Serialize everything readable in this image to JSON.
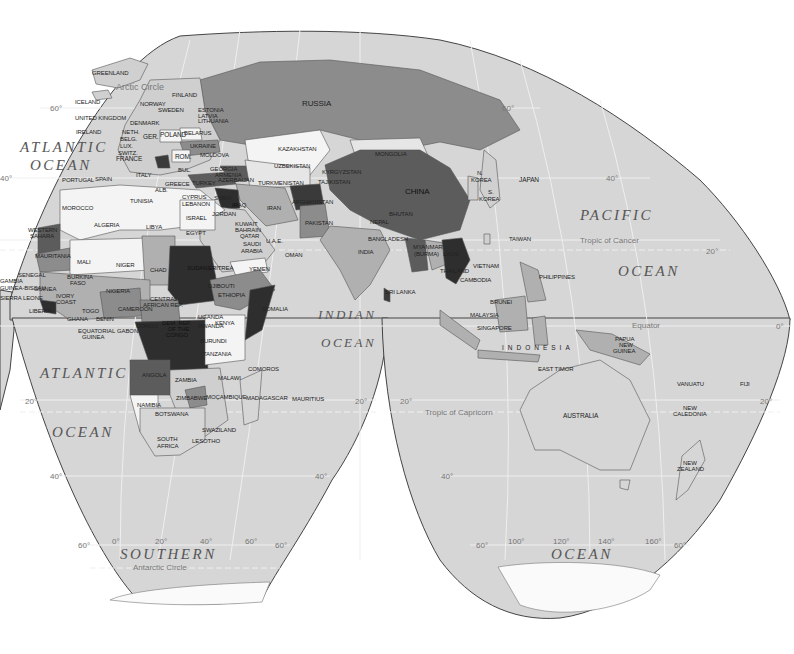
{
  "map": {
    "projection": "interrupted-equal-area",
    "colors": {
      "background": "#ffffff",
      "ocean": "#d6d6d6",
      "graticule": "#efefef",
      "outline": "#444444",
      "shade_0_white": "#f4f4f4",
      "shade_1_light": "#b9b9b9",
      "shade_2_medium": "#8c8c8c",
      "shade_3_dark": "#5c5c5c",
      "shade_4_darkest": "#2e2e2e"
    },
    "oceans": {
      "atlantic_north_1": "ATLANTIC",
      "atlantic_north_2": "OCEAN",
      "atlantic_south_1": "ATLANTIC",
      "atlantic_south_2": "OCEAN",
      "pacific_1": "PACIFIC",
      "pacific_2": "OCEAN",
      "indian_1": "INDIAN",
      "indian_2": "OCEAN",
      "southern_1": "SOUTHERN",
      "southern_2": "OCEAN"
    },
    "lines": {
      "arctic_circle": "Arctic Circle",
      "tropic_cancer": "Tropic of Cancer",
      "equator": "Equator",
      "tropic_capricorn": "Tropic of Capricorn",
      "antarctic_circle": "Antarctic Circle"
    },
    "graticule_labels": {
      "lat_60n_w": "60°",
      "lat_40n_w": "40°",
      "lat_60n_e": "60°",
      "lat_40n_e": "40°",
      "lat_20n_e": "20°",
      "lat_0_e": "0°",
      "lat_20s_w": "20°",
      "lat_20s_mid_l": "20°",
      "lat_20s_mid_r": "20°",
      "lat_20s_e": "20°",
      "lat_40s_w": "40°",
      "lat_40s_mid": "40°",
      "lat_40s_e": "40°",
      "lat_60s_1": "60°",
      "lat_60s_2": "60°",
      "lat_60s_3": "60°",
      "lat_60s_4": "60°",
      "lon_0": "0°",
      "lon_20": "20°",
      "lon_40": "40°",
      "lon_60": "60°",
      "lon_100": "100°",
      "lon_120": "120°",
      "lon_140": "140°",
      "lon_160": "160°"
    },
    "countries": {
      "greenland": "GREENLAND",
      "iceland": "ICELAND",
      "uk": "UNITED KINGDOM",
      "ireland": "IRELAND",
      "norway": "NORWAY",
      "sweden": "SWEDEN",
      "finland": "FINLAND",
      "denmark": "DENMARK",
      "estonia": "ESTONIA",
      "latvia": "LATVIA",
      "lithuania": "LITHUANIA",
      "neth": "NETH.",
      "belg": "BELG.",
      "lux": "LUX.",
      "switz": "SWITZ.",
      "ger": "GER.",
      "poland": "POLAND",
      "belarus": "BELARUS",
      "ukraine": "UKRAINE",
      "moldova": "MOLDOVA",
      "rom": "ROM.",
      "bul": "BUL.",
      "france": "FRANCE",
      "portugal": "PORTUGAL",
      "spain": "SPAIN",
      "italy": "ITALY",
      "alb": "ALB.",
      "greece": "GREECE",
      "russia": "RUSSIA",
      "georgia": "GEORGIA",
      "armenia": "ARMENIA",
      "azerbaijan": "AZERBAIJAN",
      "turkey": "TURKEY",
      "cyprus": "CYPRUS",
      "lebanon": "LEBANON",
      "syria": "SYRIA",
      "israel": "ISRAEL",
      "jordan": "JORDAN",
      "iraq": "IRAQ",
      "iran": "IRAN",
      "kuwait": "KUWAIT",
      "bahrain": "BAHRAIN",
      "qatar": "QATAR",
      "uae": "U.A.E.",
      "saudi_1": "SAUDI",
      "saudi_2": "ARABIA",
      "oman": "OMAN",
      "yemen": "YEMEN",
      "kazakhstan": "KAZAKHSTAN",
      "uzbekistan": "UZBEKISTAN",
      "turkmenistan": "TURKMENISTAN",
      "kyrgyzstan": "KYRGYZSTAN",
      "tajikistan": "TAJIKISTAN",
      "afghanistan": "AFGHANISTAN",
      "pakistan": "PAKISTAN",
      "india": "INDIA",
      "nepal": "NEPAL",
      "bhutan": "BHUTAN",
      "bangladesh": "BANGLADESH",
      "sri_lanka": "SRI LANKA",
      "mongolia": "MONGOLIA",
      "china": "CHINA",
      "n_korea_1": "N.",
      "n_korea_2": "KOREA",
      "s_korea_1": "S.",
      "s_korea_2": "KOREA",
      "japan": "JAPAN",
      "taiwan": "TAIWAN",
      "myanmar_1": "MYANMAR",
      "myanmar_2": "(BURMA)",
      "laos": "LAOS",
      "vietnam": "VIETNAM",
      "thailand": "THAILAND",
      "cambodia": "CAMBODIA",
      "philippines": "PHILIPPINES",
      "brunei": "BRUNEI",
      "malaysia": "MALAYSIA",
      "singapore": "SINGAPORE",
      "indonesia": "INDONESIA",
      "east_timor": "EAST TIMOR",
      "png_1": "PAPUA",
      "png_2": "NEW",
      "png_3": "GUINEA",
      "australia": "AUSTRALIA",
      "vanuatu": "VANUATU",
      "fiji": "FIJI",
      "new_caledonia_1": "NEW",
      "new_caledonia_2": "CALEDONIA",
      "new_zealand_1": "NEW",
      "new_zealand_2": "ZEALAND",
      "morocco": "MOROCCO",
      "algeria": "ALGERIA",
      "tunisia": "TUNISIA",
      "libya": "LIBYA",
      "egypt": "EGYPT",
      "western_sahara_1": "WESTERN",
      "western_sahara_2": "SAHARA",
      "mauritania": "MAURITANIA",
      "mali": "MALI",
      "niger": "NIGER",
      "chad": "CHAD",
      "sudan": "SUDAN",
      "eritrea": "ERITREA",
      "djibouti": "DJIBOUTI",
      "ethiopia": "ETHIOPIA",
      "somalia": "SOMALIA",
      "senegal": "SENEGAL",
      "gambia": "GAMBIA",
      "guinea_bissau": "GUINEA-BISSAU",
      "guinea": "GUINEA",
      "sierra_leone": "SIERRA LEONE",
      "liberia": "LIBERIA",
      "ivory_coast_1": "IVORY",
      "ivory_coast_2": "COAST",
      "burkina_1": "BURKINA",
      "burkina_2": "FASO",
      "ghana": "GHANA",
      "togo": "TOGO",
      "benin": "BENIN",
      "nigeria": "NIGERIA",
      "cameroon": "CAMEROON",
      "car_1": "CENTRAL",
      "car_2": "AFRICAN REP.",
      "eq_guinea_1": "EQUATORIAL",
      "eq_guinea_2": "GUINEA",
      "gabon": "GABON",
      "congo": "CONGO",
      "drc_1": "DEM. REP.",
      "drc_2": "OF THE",
      "drc_3": "CONGO",
      "uganda": "UGANDA",
      "kenya": "KENYA",
      "rwanda": "RWANDA",
      "burundi": "BURUNDI",
      "tanzania": "TANZANIA",
      "angola": "ANGOLA",
      "zambia": "ZAMBIA",
      "malawi": "MALAWI",
      "comoros": "COMOROS",
      "zimbabwe": "ZIMBABWE",
      "mozambique": "MOÇAMBIQUE",
      "madagascar": "MADAGASCAR",
      "mauritius": "MAURITIUS",
      "namibia": "NAMIBIA",
      "botswana": "BOTSWANA",
      "swaziland": "SWAZILAND",
      "lesotho": "LESOTHO",
      "south_africa_1": "SOUTH",
      "south_africa_2": "AFRICA"
    }
  }
}
